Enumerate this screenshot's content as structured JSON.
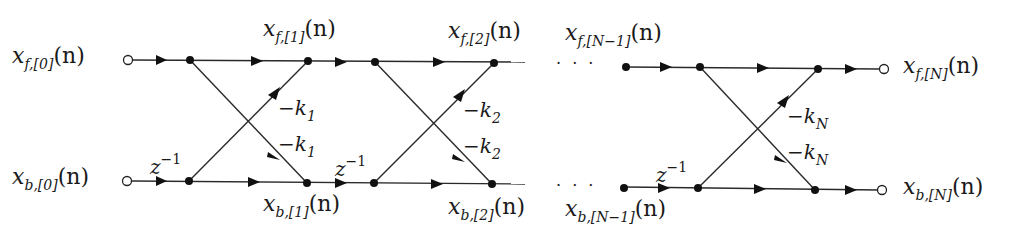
{
  "diagram": {
    "colors": {
      "line": "#2a2a2a",
      "node": "#111111",
      "background": "#ffffff"
    },
    "inputs": {
      "forward": {
        "var": "x",
        "sub": "f,[0]",
        "arg": "(n)"
      },
      "backward": {
        "var": "x",
        "sub": "b,[0]",
        "arg": "(n)"
      }
    },
    "outputs": {
      "forward": {
        "var": "x",
        "sub": "f,[N]",
        "arg": "(n)"
      },
      "backward": {
        "var": "x",
        "sub": "b,[N]",
        "arg": "(n)"
      }
    },
    "intermediate": [
      {
        "var": "x",
        "sub": "f,[1]",
        "arg": "(n)"
      },
      {
        "var": "x",
        "sub": "b,[1]",
        "arg": "(n)"
      },
      {
        "var": "x",
        "sub": "f,[2]",
        "arg": "(n)"
      },
      {
        "var": "x",
        "sub": "b,[2]",
        "arg": "(n)"
      },
      {
        "var": "x",
        "sub": "f,[N−1]",
        "arg": "(n)"
      },
      {
        "var": "x",
        "sub": "b,[N−1]",
        "arg": "(n)"
      }
    ],
    "stages": [
      {
        "gain_upper": "−k",
        "gain_upper_sub": "1",
        "gain_lower": "−k",
        "gain_lower_sub": "1",
        "delay": "z",
        "delay_sup": "−1"
      },
      {
        "gain_upper": "−k",
        "gain_upper_sub": "2",
        "gain_lower": "−k",
        "gain_lower_sub": "2",
        "delay": "z",
        "delay_sup": "−1"
      },
      {
        "gain_upper": "−k",
        "gain_upper_sub": "N",
        "gain_lower": "−k",
        "gain_lower_sub": "N",
        "delay": "z",
        "delay_sup": "−1"
      }
    ],
    "ellipsis": "· · ·"
  }
}
